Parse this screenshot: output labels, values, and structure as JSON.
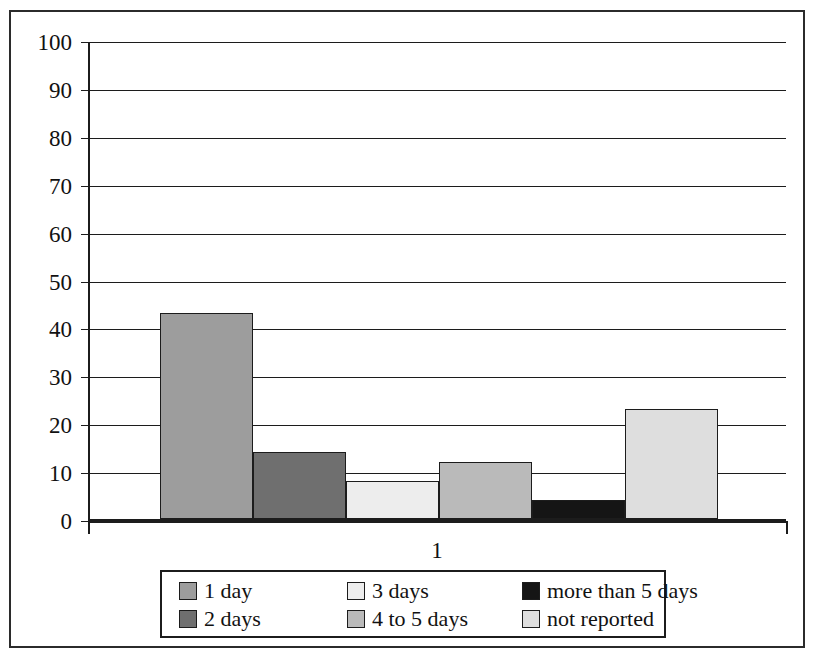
{
  "chart_data": {
    "type": "bar",
    "title": "",
    "subtitle": "",
    "xlabel": "",
    "ylabel": "",
    "categories": [
      "1"
    ],
    "x": [
      "1"
    ],
    "ylim": [
      0,
      100
    ],
    "yticks": [
      0,
      10,
      20,
      30,
      40,
      50,
      60,
      70,
      80,
      90,
      100
    ],
    "ytick_labels": [
      "0",
      "10",
      "20",
      "30",
      "40",
      "50",
      "60",
      "70",
      "80",
      "90",
      "100"
    ],
    "xtick_labels": [
      "1"
    ],
    "grid": "horizontal",
    "legend_position": "bottom",
    "series": [
      {
        "name": "1 day",
        "values": [
          43
        ],
        "color": "#9d9d9d"
      },
      {
        "name": "2 days",
        "values": [
          14
        ],
        "color": "#6f6f6f"
      },
      {
        "name": "3 days",
        "values": [
          8
        ],
        "color": "#ededed"
      },
      {
        "name": "4 to 5 days",
        "values": [
          12
        ],
        "color": "#bababa"
      },
      {
        "name": "more than 5 days",
        "values": [
          4
        ],
        "color": "#151515"
      },
      {
        "name": "not reported",
        "values": [
          23
        ],
        "color": "#dedede"
      }
    ]
  },
  "legend": {
    "entries": [
      {
        "label": "1 day",
        "color": "#9d9d9d"
      },
      {
        "label": "3 days",
        "color": "#ededed"
      },
      {
        "label": "more than 5 days",
        "color": "#151515"
      },
      {
        "label": "2 days",
        "color": "#6f6f6f"
      },
      {
        "label": "4 to 5 days",
        "color": "#bababa"
      },
      {
        "label": "not reported",
        "color": "#dedede"
      }
    ]
  },
  "axes": {
    "x_tick_label": "1"
  }
}
